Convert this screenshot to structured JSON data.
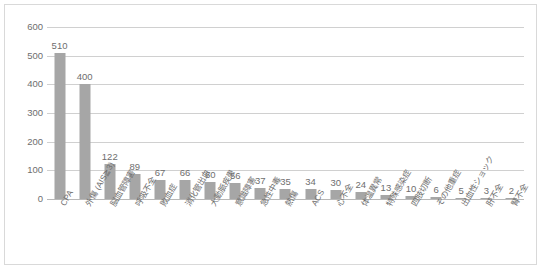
{
  "chart_data": {
    "type": "bar",
    "title": "",
    "subtitle": "",
    "xlabel": "",
    "ylabel": "",
    "ylim": [
      0,
      600
    ],
    "ytick_labels": [
      "0",
      "100",
      "200",
      "300",
      "400",
      "500",
      "600"
    ],
    "ytick_values": [
      0,
      100,
      200,
      300,
      400,
      500,
      600
    ],
    "grid": true,
    "legend": false,
    "legend_position": "none",
    "bar_color": "#a6a6a6",
    "gridline_color": "#d0d0d0",
    "label_color": "#6e6e6e",
    "categories": [
      "CPA",
      "外傷 (AIS≧3)",
      "脳血管障害",
      "呼吸不全",
      "敗血症",
      "消化管出血",
      "大動脈疾患",
      "意識障害",
      "急性中毒",
      "熱傷",
      "ACS",
      "心不全",
      "体温異常",
      "特殊感染症",
      "四肢切断",
      "その他重症",
      "出血性ショック",
      "肝不全",
      "腎不全"
    ],
    "values": [
      510,
      400,
      122,
      89,
      67,
      66,
      60,
      56,
      37,
      35,
      34,
      30,
      24,
      13,
      10,
      6,
      5,
      3,
      2
    ],
    "data_labels": [
      "510",
      "400",
      "122",
      "89",
      "67",
      "66",
      "60",
      "56",
      "37",
      "35",
      "34",
      "30",
      "24",
      "13",
      "10",
      "6",
      "5",
      "3",
      "2"
    ]
  }
}
